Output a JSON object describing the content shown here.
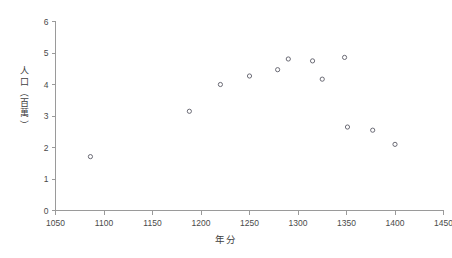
{
  "chart_data": {
    "type": "scatter",
    "title": "",
    "xlabel": "年分",
    "ylabel": "人口（百萬）",
    "xlim": [
      1050,
      1450
    ],
    "ylim": [
      0,
      6
    ],
    "xticks": [
      1050,
      1100,
      1150,
      1200,
      1250,
      1300,
      1350,
      1400,
      1450
    ],
    "xticklabels": [
      "1050",
      "1100",
      "1150",
      "1200",
      "1250",
      "1300",
      "1350",
      "1400",
      "1450"
    ],
    "yticks": [
      0,
      1,
      2,
      3,
      4,
      5,
      6
    ],
    "yticklabels": [
      "0",
      "1",
      "2",
      "3",
      "4",
      "5",
      "6"
    ],
    "grid": false,
    "legend": false,
    "marker": "open-circle",
    "marker_color": "#5b5b66",
    "x": [
      1086,
      1188,
      1220,
      1250,
      1279,
      1290,
      1315,
      1325,
      1348,
      1351,
      1377,
      1400
    ],
    "y": [
      1.71,
      3.15,
      4.0,
      4.27,
      4.47,
      4.81,
      4.75,
      4.17,
      4.86,
      2.65,
      2.55,
      2.1
    ],
    "points": [
      {
        "year": 1086,
        "population": 1.71
      },
      {
        "year": 1188,
        "population": 3.15
      },
      {
        "year": 1220,
        "population": 4.0
      },
      {
        "year": 1250,
        "population": 4.27
      },
      {
        "year": 1279,
        "population": 4.47
      },
      {
        "year": 1290,
        "population": 4.81
      },
      {
        "year": 1315,
        "population": 4.75
      },
      {
        "year": 1325,
        "population": 4.17
      },
      {
        "year": 1348,
        "population": 4.86
      },
      {
        "year": 1351,
        "population": 2.65
      },
      {
        "year": 1377,
        "population": 2.55
      },
      {
        "year": 1400,
        "population": 2.1
      }
    ]
  },
  "axis_label_chars": {
    "ylabel_parts": [
      "人",
      "口",
      "（",
      "百",
      "萬",
      "）"
    ]
  },
  "colors": {
    "axis": "#9a9a9a",
    "text": "#4a4a4a",
    "marker": "#5b5b66",
    "background": "#ffffff"
  }
}
